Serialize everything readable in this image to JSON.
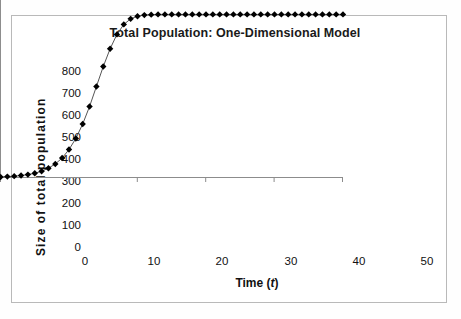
{
  "chart_data": {
    "type": "line",
    "title": "Total Population: One-Dimensional Model",
    "xlabel": "Time (t)",
    "xlabel_plain": "Time",
    "xlabel_variable": "t",
    "ylabel": "Size  of  total  population",
    "xlim": [
      0,
      50
    ],
    "ylim": [
      0,
      800
    ],
    "xticks": [
      0,
      10,
      20,
      30,
      40,
      50
    ],
    "yticks": [
      0,
      100,
      200,
      300,
      400,
      500,
      600,
      700,
      800
    ],
    "grid": false,
    "legend": null,
    "marker": "diamond",
    "marker_color": "#000000",
    "line_color": "#555555",
    "x": [
      0,
      1,
      2,
      3,
      4,
      5,
      6,
      7,
      8,
      9,
      10,
      11,
      12,
      13,
      14,
      15,
      16,
      17,
      18,
      19,
      20,
      21,
      22,
      23,
      24,
      25,
      26,
      27,
      28,
      29,
      30,
      31,
      32,
      33,
      34,
      35,
      36,
      37,
      38,
      39,
      40,
      41,
      42,
      43,
      44,
      45,
      46,
      47,
      48,
      49,
      50
    ],
    "values": [
      2,
      4,
      6,
      9,
      13,
      19,
      28,
      42,
      61,
      88,
      126,
      176,
      241,
      320,
      410,
      500,
      580,
      645,
      690,
      715,
      727,
      732,
      734,
      735,
      735,
      735,
      735,
      735,
      735,
      735,
      735,
      735,
      735,
      735,
      735,
      735,
      735,
      735,
      735,
      735,
      735,
      735,
      735,
      735,
      735,
      735,
      735,
      735,
      735,
      735,
      735
    ],
    "series": [
      {
        "name": "Total population",
        "values": [
          2,
          4,
          6,
          9,
          13,
          19,
          28,
          42,
          61,
          88,
          126,
          176,
          241,
          320,
          410,
          500,
          580,
          645,
          690,
          715,
          727,
          732,
          734,
          735,
          735,
          735,
          735,
          735,
          735,
          735,
          735,
          735,
          735,
          735,
          735,
          735,
          735,
          735,
          735,
          735,
          735,
          735,
          735,
          735,
          735,
          735,
          735,
          735,
          735,
          735,
          735
        ]
      }
    ],
    "carrying_capacity": 735,
    "axis_color": "#8c8c8c",
    "border_color": "#b9b9b9"
  }
}
